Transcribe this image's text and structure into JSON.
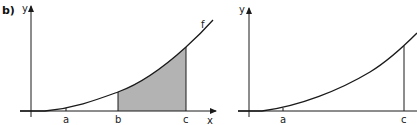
{
  "figure_label": "b)",
  "colors": {
    "stroke": "#1a1a1a",
    "shade": "#b3b3b3",
    "background": "#ffffff"
  },
  "left_plot": {
    "y_axis_label": "y",
    "x_axis_label": "x",
    "function_label": "f",
    "ticks": [
      {
        "label": "a",
        "x": 66
      },
      {
        "label": "b",
        "x": 118
      },
      {
        "label": "c",
        "x": 186
      }
    ],
    "shaded_region": {
      "from": "b",
      "to": "c"
    }
  },
  "right_plot": {
    "y_axis_label": "y",
    "ticks": [
      {
        "label": "a",
        "x": 283
      },
      {
        "label": "c",
        "x": 404
      }
    ]
  }
}
